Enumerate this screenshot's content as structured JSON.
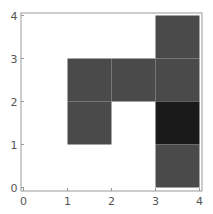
{
  "chart_data": {
    "type": "heatmap",
    "title": "",
    "xlabel": "",
    "ylabel": "",
    "xlim": [
      0,
      4
    ],
    "ylim": [
      0,
      4
    ],
    "grid": false,
    "x_ticks": [
      "0",
      "1",
      "2",
      "3",
      "4"
    ],
    "y_ticks": [
      "0",
      "1",
      "2",
      "3",
      "4"
    ],
    "cells": [
      {
        "x": 3,
        "y": 3,
        "shade": "medium",
        "color": "#4a4a4a"
      },
      {
        "x": 1,
        "y": 2,
        "shade": "medium",
        "color": "#4a4a4a"
      },
      {
        "x": 2,
        "y": 2,
        "shade": "medium",
        "color": "#4a4a4a"
      },
      {
        "x": 3,
        "y": 2,
        "shade": "medium",
        "color": "#4a4a4a"
      },
      {
        "x": 1,
        "y": 1,
        "shade": "medium",
        "color": "#4a4a4a"
      },
      {
        "x": 3,
        "y": 1,
        "shade": "dark",
        "color": "#1a1a1a"
      },
      {
        "x": 3,
        "y": 0,
        "shade": "medium",
        "color": "#4a4a4a"
      }
    ],
    "colors": {
      "background": "#ffffff",
      "frame": "#999999",
      "medium": "#4a4a4a",
      "dark": "#1a1a1a"
    }
  }
}
